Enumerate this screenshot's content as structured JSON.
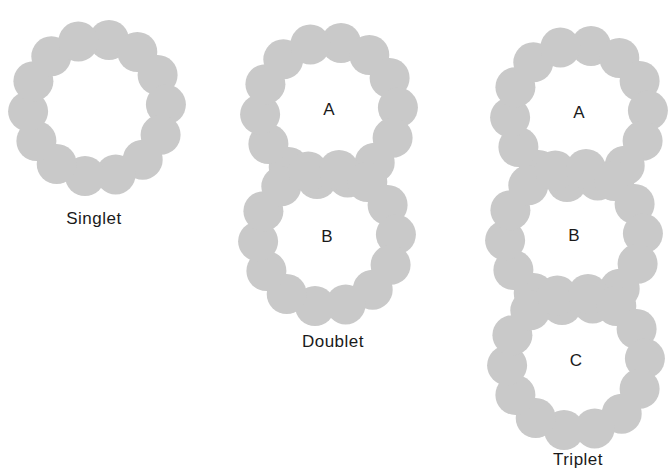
{
  "style": {
    "bead_color": "#c9c9c9",
    "text_color": "#1a1a1a"
  },
  "groups": [
    {
      "name": "singlet",
      "caption": "Singlet",
      "caption_pos": [
        94,
        224
      ],
      "rings": [
        {
          "label": "",
          "cx": 97,
          "cy": 108,
          "r": 69,
          "beads": 14,
          "bead_r": 20,
          "start_deg": -80
        }
      ]
    },
    {
      "name": "doublet",
      "caption": "Doublet",
      "caption_pos": [
        333,
        347
      ],
      "rings": [
        {
          "label": "A",
          "cx": 329,
          "cy": 111,
          "r": 69,
          "beads": 14,
          "bead_r": 20,
          "start_deg": -80
        },
        {
          "label": "B",
          "cx": 327,
          "cy": 238,
          "r": 69,
          "beads": 14,
          "bead_r": 20,
          "start_deg": 100
        }
      ]
    },
    {
      "name": "triplet",
      "caption": "Triplet",
      "caption_pos": [
        578,
        465
      ],
      "rings": [
        {
          "label": "A",
          "cx": 579,
          "cy": 114,
          "r": 69,
          "beads": 14,
          "bead_r": 20,
          "start_deg": -80
        },
        {
          "label": "B",
          "cx": 574,
          "cy": 237,
          "r": 69,
          "beads": 14,
          "bead_r": 20,
          "start_deg": 100
        },
        {
          "label": "C",
          "cx": 576,
          "cy": 362,
          "r": 69,
          "beads": 14,
          "bead_r": 20,
          "start_deg": 100
        }
      ]
    }
  ]
}
